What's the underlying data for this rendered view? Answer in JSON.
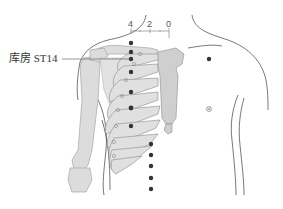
{
  "figure": {
    "point_label": "库房 ST14",
    "scale": {
      "ticks": [
        "4",
        "2",
        "0"
      ]
    },
    "colors": {
      "bone": "#d9d9d9",
      "bone_outline": "#9a9a9a",
      "body_outline": "#555555",
      "acupoint": "#333333",
      "background": "#ffffff"
    }
  }
}
